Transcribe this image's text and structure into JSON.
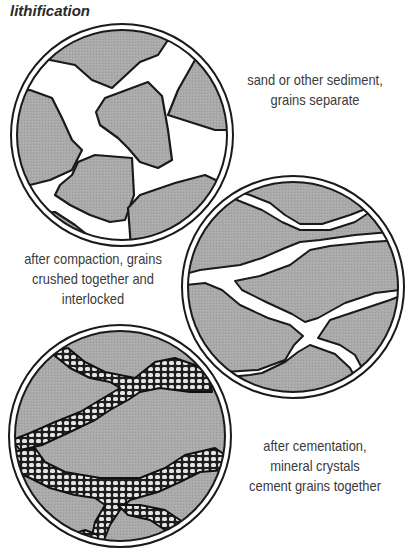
{
  "title": "lithification",
  "stages": [
    {
      "id": "sediment",
      "caption_lines": [
        "sand or other sediment,",
        "grains separate"
      ]
    },
    {
      "id": "compaction",
      "caption_lines": [
        "after compaction, grains",
        "crushed together and",
        "interlocked"
      ]
    },
    {
      "id": "cementation",
      "caption_lines": [
        "after cementation,",
        "mineral crystals",
        "cement grains together"
      ]
    }
  ],
  "colors": {
    "grain_fill": "#a9a9a9",
    "outline": "#1a1a1a",
    "pore": "#ffffff",
    "cement_fill": "#d9d9d9",
    "text": "#3a3a3a"
  }
}
